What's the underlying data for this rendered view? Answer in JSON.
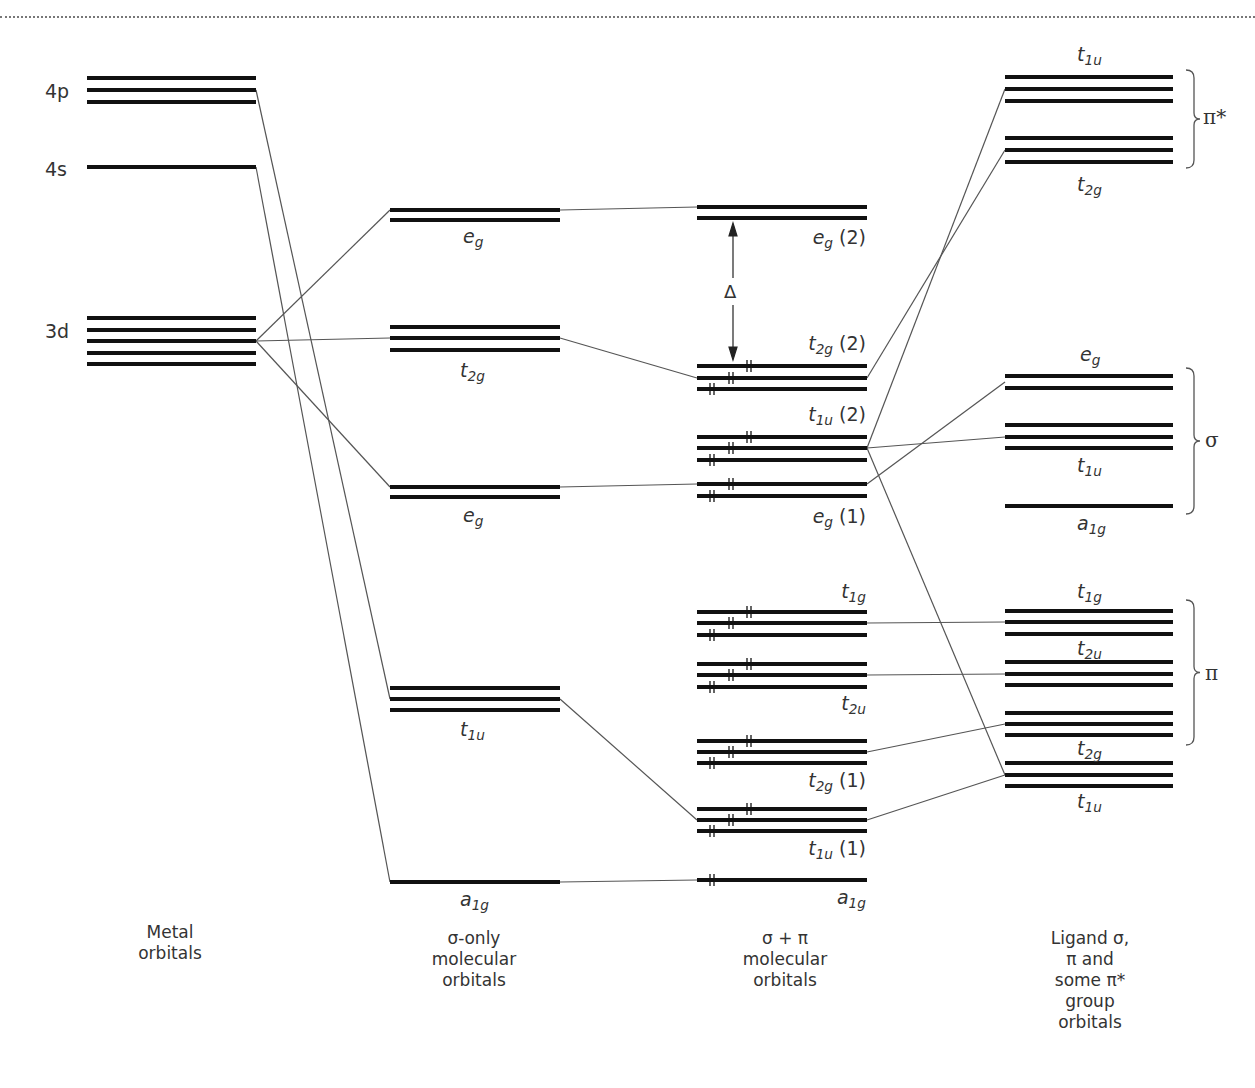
{
  "diagram": {
    "columns": [
      {
        "id": "metal",
        "caption": "Metal\norbitals"
      },
      {
        "id": "sigma_only",
        "caption": "σ-only\nmolecular\norbitals"
      },
      {
        "id": "sigma_pi",
        "caption": "σ + π\nmolecular\norbitals"
      },
      {
        "id": "ligand",
        "caption": "Ligand σ,\nπ and\nsome π*\ngroup\norbitals"
      }
    ],
    "metal_levels": [
      {
        "label": "4p",
        "degeneracy": 3,
        "y": [
          78,
          90,
          102
        ]
      },
      {
        "label": "4s",
        "degeneracy": 1,
        "y": [
          167
        ]
      },
      {
        "label": "3d",
        "degeneracy": 5,
        "y": [
          318,
          330,
          341,
          353,
          364
        ]
      }
    ],
    "sigma_only_levels": [
      {
        "sym": "e",
        "sub": "g",
        "y": [
          210,
          220
        ]
      },
      {
        "sym": "t",
        "sub": "2g",
        "y": [
          327,
          338,
          350
        ]
      },
      {
        "sym": "e",
        "sub": "g",
        "y": [
          487,
          497
        ]
      },
      {
        "sym": "t",
        "sub": "1u",
        "y": [
          688,
          699,
          710
        ]
      },
      {
        "sym": "a",
        "sub": "1g",
        "y": [
          882
        ]
      }
    ],
    "sigma_pi_levels": [
      {
        "sym": "e",
        "sub": "g",
        "suffix": " (2)",
        "y": [
          207,
          218
        ],
        "electrons": 0
      },
      {
        "sym": "t",
        "sub": "2g",
        "suffix": " (2)",
        "y": [
          366,
          378,
          389
        ],
        "electrons": 6
      },
      {
        "sym": "t",
        "sub": "1u",
        "suffix": "  (2)",
        "y": [
          437,
          448,
          460
        ],
        "electrons": 6
      },
      {
        "sym": "e",
        "sub": "g",
        "suffix": " (1)",
        "y": [
          484,
          496
        ],
        "electrons": 4
      },
      {
        "sym": "t",
        "sub": "1g",
        "suffix": "",
        "y": [
          612,
          623,
          635
        ],
        "electrons": 6
      },
      {
        "sym": "t",
        "sub": "2u",
        "suffix": "",
        "y": [
          664,
          675,
          687
        ],
        "electrons": 6
      },
      {
        "sym": "t",
        "sub": "2g",
        "suffix": " (1)",
        "y": [
          741,
          752,
          763
        ],
        "electrons": 6
      },
      {
        "sym": "t",
        "sub": "1u",
        "suffix": " (1)",
        "y": [
          809,
          820,
          831
        ],
        "electrons": 6
      },
      {
        "sym": "a",
        "sub": "1g",
        "suffix": "",
        "y": [
          880
        ],
        "electrons": 2
      }
    ],
    "ligand_levels": [
      {
        "sym": "t",
        "sub": "1u",
        "group": "π*",
        "y": [
          77,
          89,
          101
        ]
      },
      {
        "sym": "t",
        "sub": "2g",
        "group": "π*",
        "y": [
          138,
          150,
          162
        ]
      },
      {
        "sym": "e",
        "sub": "g",
        "group": "σ",
        "y": [
          376,
          388
        ]
      },
      {
        "sym": "t",
        "sub": "1u",
        "group": "σ",
        "y": [
          425,
          437,
          448
        ]
      },
      {
        "sym": "a",
        "sub": "1g",
        "group": "σ",
        "y": [
          506
        ]
      },
      {
        "sym": "t",
        "sub": "1g",
        "group": "π",
        "y": [
          611,
          622,
          634
        ]
      },
      {
        "sym": "t",
        "sub": "2u",
        "group": "π",
        "y": [
          662,
          674,
          685
        ]
      },
      {
        "sym": "t",
        "sub": "2g",
        "group": "π",
        "y": [
          713,
          724,
          735
        ]
      },
      {
        "sym": "t",
        "sub": "1u",
        "group": "",
        "y": [
          763,
          775,
          786
        ]
      }
    ],
    "brace_groups": [
      {
        "label": "π*",
        "y_top": 70,
        "y_bottom": 168
      },
      {
        "label": "σ",
        "y_top": 368,
        "y_bottom": 514
      },
      {
        "label": "π",
        "y_top": 600,
        "y_bottom": 745
      }
    ],
    "splitting_label": "Δ"
  }
}
